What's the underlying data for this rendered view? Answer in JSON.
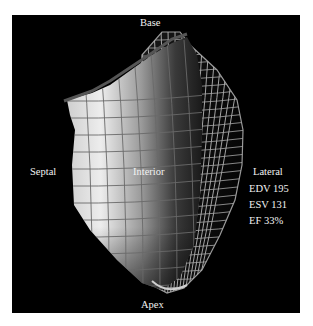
{
  "figure": {
    "labels": {
      "top": "Base",
      "bottom": "Apex",
      "left": "Septal",
      "center": "Interior",
      "right": "Lateral"
    },
    "metrics": [
      {
        "name": "EDV",
        "value": "195",
        "text": "EDV 195"
      },
      {
        "name": "ESV",
        "value": "131",
        "text": "ESV 131"
      },
      {
        "name": "EF",
        "value": "33%",
        "text": "EF 33%"
      }
    ],
    "colors": {
      "background": "#000000",
      "frame": "#ffffff",
      "text": "#f2f2f2",
      "surface_light": "#e8e8e8",
      "surface_dark": "#2a2a2a",
      "mesh": "#bdbdbd"
    }
  }
}
